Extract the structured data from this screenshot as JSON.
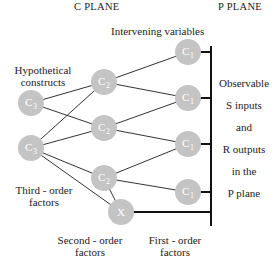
{
  "headers": {
    "c_plane": "C PLANE",
    "p_plane": "P PLANE"
  },
  "labels": {
    "intervening_variables": "Intervening variables",
    "hypothetical_constructs": [
      "Hypothetical",
      "constructs"
    ],
    "third_order": [
      "Third - order",
      "factors"
    ],
    "second_order": [
      "Second - order",
      "factors"
    ],
    "first_order": [
      "First - order",
      "factors"
    ],
    "observable": [
      "Observable",
      "S  inputs",
      "and",
      "R  outputs",
      "in  the",
      "P  plane"
    ]
  },
  "nodes": {
    "c3_top": {
      "letter": "C",
      "sub": "3"
    },
    "c3_bottom": {
      "letter": "C",
      "sub": "3"
    },
    "c2_top": {
      "letter": "C",
      "sub": "2"
    },
    "c2_mid": {
      "letter": "C",
      "sub": "2"
    },
    "c2_bottom": {
      "letter": "C",
      "sub": "2"
    },
    "c1_1": {
      "letter": "C",
      "sub": "1"
    },
    "c1_2": {
      "letter": "C",
      "sub": "1"
    },
    "c1_3": {
      "letter": "C",
      "sub": "1"
    },
    "c1_4": {
      "letter": "C",
      "sub": "1"
    },
    "x": {
      "letter": "X"
    }
  },
  "colors": {
    "node_fill": "#c4c4c4",
    "line": "#333333",
    "text": "#222222"
  }
}
